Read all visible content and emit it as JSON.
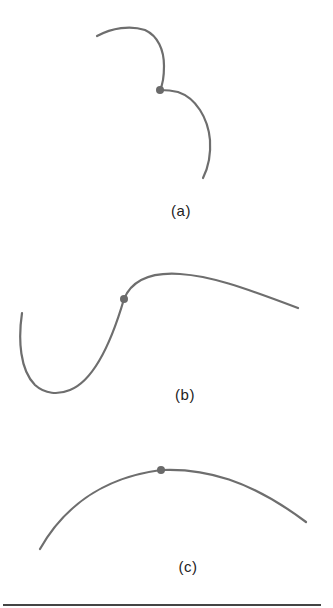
{
  "figure": {
    "panels": [
      {
        "id": "a",
        "label": "(a)",
        "description": "curve with a cusp-like kink at the marked point",
        "point": {
          "x": 160,
          "y": 90
        }
      },
      {
        "id": "b",
        "label": "(b)",
        "description": "S-shaped curve with inflection at the marked point",
        "point": {
          "x": 124,
          "y": 299
        }
      },
      {
        "id": "c",
        "label": "(c)",
        "description": "smooth arc with the marked point at its top",
        "point": {
          "x": 161,
          "y": 470
        }
      }
    ],
    "colors": {
      "curve": "#6e6e6e",
      "point": "#6a6a6a",
      "rule": "#444444"
    }
  }
}
